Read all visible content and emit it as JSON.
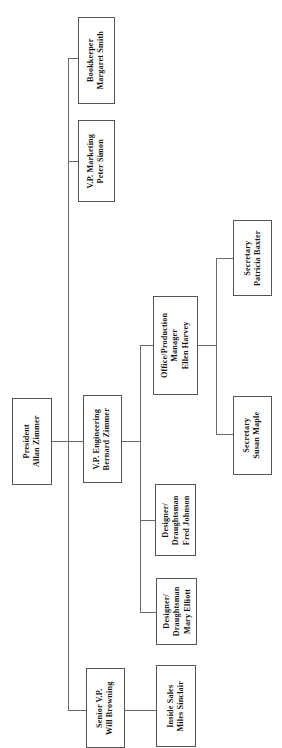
{
  "chart": {
    "orientation": "rotated-90-ccw",
    "background_color": "#ffffff",
    "box_border_color": "#555555",
    "line_color": "#6a6a6a",
    "text_color": "#151515",
    "nodes": [
      {
        "id": "bookkeeper",
        "title": "Bookkeeper",
        "name": "Margaret  Smith",
        "reports_to": "president"
      },
      {
        "id": "vp-marketing",
        "title": "V.P.  Marketing",
        "name": "Peter  Simon",
        "reports_to": "president"
      },
      {
        "id": "president",
        "title": "President",
        "name": "Allan  Zimmer",
        "reports_to": null
      },
      {
        "id": "vp-engineering",
        "title": "V.P.  Engineering",
        "name": "Bernard  Zimmer",
        "reports_to": "president"
      },
      {
        "id": "office-production-manager",
        "title": "Office/Production",
        "subtitle": "Manager",
        "name": "Ellen  Harvey",
        "reports_to": "vp-engineering"
      },
      {
        "id": "secretary-baxter",
        "title": "Secretary",
        "name": "Patricia  Baxter",
        "reports_to": "office-production-manager"
      },
      {
        "id": "secretary-maple",
        "title": "Secretary",
        "name": "Susan  Maple",
        "reports_to": "office-production-manager"
      },
      {
        "id": "designer-johnson",
        "title": "Designer/",
        "subtitle": "Draughtsman",
        "name": "Fred  Johnson",
        "reports_to": "vp-engineering"
      },
      {
        "id": "designer-elliott",
        "title": "Designer/",
        "subtitle": "Draughtsman",
        "name": "Mary  Elliott",
        "reports_to": "vp-engineering"
      },
      {
        "id": "senior-vp",
        "title": "Senior  V.P.",
        "name": "Will  Browning",
        "reports_to": "president"
      },
      {
        "id": "inside-sales",
        "title": "Inside  Sales",
        "name": "Miles  Sinclair",
        "reports_to": "senior-vp"
      }
    ]
  }
}
